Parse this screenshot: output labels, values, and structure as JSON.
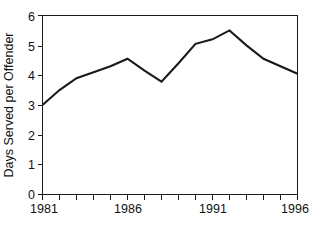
{
  "chart_data": {
    "type": "line",
    "title": "",
    "xlabel": "",
    "ylabel": "Days Served per Offender",
    "x": [
      1981,
      1982,
      1983,
      1984,
      1985,
      1986,
      1987,
      1988,
      1989,
      1990,
      1991,
      1992,
      1993,
      1994,
      1995,
      1996
    ],
    "values": [
      3.0,
      3.5,
      3.9,
      4.1,
      4.3,
      4.55,
      4.15,
      3.78,
      4.4,
      5.05,
      5.2,
      5.5,
      5.0,
      4.55,
      4.3,
      4.05
    ],
    "series": [
      {
        "name": "Days Served per Offender",
        "values": [
          3.0,
          3.5,
          3.9,
          4.1,
          4.3,
          4.55,
          4.15,
          3.78,
          4.4,
          5.05,
          5.2,
          5.5,
          5.0,
          4.55,
          4.3,
          4.05
        ]
      }
    ],
    "xlim": [
      1981,
      1996
    ],
    "ylim": [
      0,
      6
    ],
    "x_tick_values": [
      1981,
      1982,
      1983,
      1984,
      1985,
      1986,
      1987,
      1988,
      1989,
      1990,
      1991,
      1992,
      1993,
      1994,
      1995,
      1996
    ],
    "x_tick_labels": [
      "1981",
      "",
      "",
      "",
      "",
      "1986",
      "",
      "",
      "",
      "",
      "1991",
      "",
      "",
      "",
      "",
      "1996"
    ],
    "y_tick_values": [
      0,
      1,
      2,
      3,
      4,
      5,
      6
    ],
    "y_tick_labels": [
      "0",
      "1",
      "2",
      "3",
      "4",
      "5",
      "6"
    ],
    "grid": false,
    "legend": false,
    "legend_position": "none",
    "line_color": "#1a1a1a",
    "background_color": "#ffffff",
    "annotations": []
  },
  "axis": {
    "y_title": "Days Served per Offender"
  }
}
